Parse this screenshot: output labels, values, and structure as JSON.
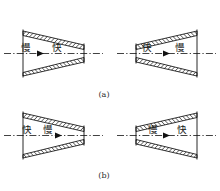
{
  "figure": {
    "background_color": "#ffffff",
    "line_color": "#111111",
    "hatch_color": "#111111",
    "width": 220,
    "height": 191,
    "captions": [
      {
        "id": "caption-a",
        "text": "(a)"
      },
      {
        "id": "caption-b",
        "text": "(b)"
      }
    ],
    "labels": {
      "slow": "慢",
      "fast": "快"
    },
    "panels": [
      {
        "id": "panel-top-left",
        "row": "a",
        "position": "left",
        "shape": "converging",
        "left_label": "慢",
        "right_label": "快",
        "arrow_direction": "right"
      },
      {
        "id": "panel-top-right",
        "row": "a",
        "position": "right",
        "shape": "diverging",
        "left_label": "快",
        "right_label": "慢",
        "arrow_direction": "right"
      },
      {
        "id": "panel-bottom-left",
        "row": "b",
        "position": "left",
        "shape": "converging",
        "left_label": "快",
        "right_label": "慢",
        "arrow_direction": "right"
      },
      {
        "id": "panel-bottom-right",
        "row": "b",
        "position": "right",
        "shape": "diverging",
        "left_label": "慢",
        "right_label": "快",
        "arrow_direction": "right"
      }
    ]
  }
}
